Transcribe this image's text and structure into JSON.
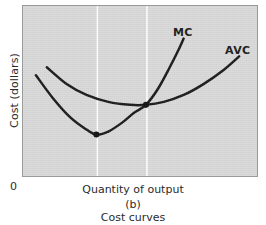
{
  "figure": {
    "panel_letter": "(b)",
    "caption": "Cost curves",
    "origin_label": "0",
    "background_color": "#d9d9d9",
    "border_color": "#9a9a9a",
    "curve_color": "#1a1a1a",
    "gridline_color": "#ffffff"
  },
  "axes": {
    "y_label": "Cost (dollars)",
    "x_label": "Quantity of output"
  },
  "chart_data": {
    "type": "line",
    "title": "Cost curves",
    "subtitle": "(b)",
    "xlabel": "Quantity of output",
    "ylabel": "Cost (dollars)",
    "xlim": [
      0,
      236
    ],
    "ylim": [
      0,
      172
    ],
    "grid": true,
    "grid_orientation": "vertical",
    "gridlines_x": [
      75,
      125
    ],
    "legend_position": "inline-end-of-curve",
    "series": [
      {
        "name": "MC",
        "label": "MC",
        "label_position": {
          "x": 150,
          "y": 20
        },
        "color": "#1a1a1a",
        "points": [
          {
            "x": 13,
            "y": 70
          },
          {
            "x": 30,
            "y": 93
          },
          {
            "x": 48,
            "y": 113
          },
          {
            "x": 64,
            "y": 125
          },
          {
            "x": 74,
            "y": 130
          },
          {
            "x": 86,
            "y": 127
          },
          {
            "x": 100,
            "y": 118
          },
          {
            "x": 112,
            "y": 108
          },
          {
            "x": 124,
            "y": 100
          },
          {
            "x": 136,
            "y": 84
          },
          {
            "x": 148,
            "y": 62
          },
          {
            "x": 158,
            "y": 42
          },
          {
            "x": 162,
            "y": 33
          }
        ],
        "markers": [
          {
            "name": "mc-minimum",
            "x": 74,
            "y": 130
          }
        ]
      },
      {
        "name": "AVC",
        "label": "AVC",
        "label_position": {
          "x": 202,
          "y": 38
        },
        "color": "#1a1a1a",
        "points": [
          {
            "x": 24,
            "y": 62
          },
          {
            "x": 44,
            "y": 79
          },
          {
            "x": 64,
            "y": 90
          },
          {
            "x": 86,
            "y": 97
          },
          {
            "x": 108,
            "y": 100
          },
          {
            "x": 124,
            "y": 100
          },
          {
            "x": 142,
            "y": 97
          },
          {
            "x": 162,
            "y": 90
          },
          {
            "x": 182,
            "y": 79
          },
          {
            "x": 202,
            "y": 65
          },
          {
            "x": 218,
            "y": 51
          }
        ],
        "markers": [
          {
            "name": "mc-avc-intersection",
            "x": 124,
            "y": 100
          }
        ]
      }
    ],
    "annotations": [
      {
        "name": "mc-minimum-dot",
        "x": 74,
        "y": 130,
        "note": "minimum of MC curve"
      },
      {
        "name": "intersection-dot",
        "x": 124,
        "y": 100,
        "note": "MC crosses AVC at AVC minimum"
      }
    ]
  }
}
